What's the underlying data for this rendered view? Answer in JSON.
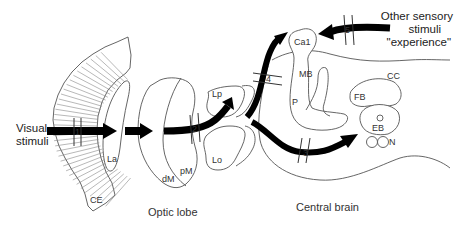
{
  "inputs": {
    "visual": [
      "Visual",
      "stimuli"
    ],
    "other": [
      "Other sensory",
      "stimuli",
      "\"experience\""
    ]
  },
  "regions": {
    "ce": "CE",
    "la": "La",
    "dm": "dM",
    "pm": "pM",
    "lp": "Lp",
    "lo": "Lo",
    "ca1": "Ca1",
    "mb": "MB",
    "p": "P",
    "cc": "CC",
    "fb": "FB",
    "eb": "EB",
    "n": "N"
  },
  "gates": [
    "1",
    "2",
    "3",
    "4",
    "5"
  ],
  "captions": {
    "optic_lobe": "Optic lobe",
    "central_brain": "Central brain"
  }
}
